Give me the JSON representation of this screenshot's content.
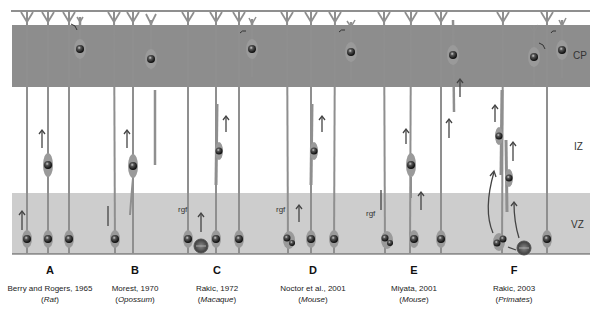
{
  "zones": {
    "cp": {
      "label": "CP",
      "y_top": 25,
      "y_bottom": 87,
      "color": "#8a8a8a"
    },
    "iz": {
      "label": "IZ",
      "y_top": 87,
      "y_bottom": 193,
      "color": "#ffffff"
    },
    "vz": {
      "label": "VZ",
      "y_top": 193,
      "y_bottom": 254,
      "color": "#cfcfcf"
    }
  },
  "rgf_label": "rgf",
  "panels": [
    {
      "letter": "A",
      "author": "Berry and Rogers, 1965",
      "species": "Rat",
      "x": 50
    },
    {
      "letter": "B",
      "author": "Morest, 1970",
      "species": "Opossum",
      "x": 135
    },
    {
      "letter": "C",
      "author": "Rakic, 1972",
      "species": "Macaque",
      "x": 217
    },
    {
      "letter": "D",
      "author": "Noctor et al., 2001",
      "species": "Mouse",
      "x": 313
    },
    {
      "letter": "E",
      "author": "Miyata, 2001",
      "species": "Mouse",
      "x": 414
    },
    {
      "letter": "F",
      "author": "Rakic, 2003",
      "species": "Primates",
      "x": 514
    }
  ],
  "colors": {
    "fiber": "#8f8f8f",
    "nucleus": "#2a2a2a",
    "arrow": "#555555",
    "axis_line": "#666666"
  }
}
